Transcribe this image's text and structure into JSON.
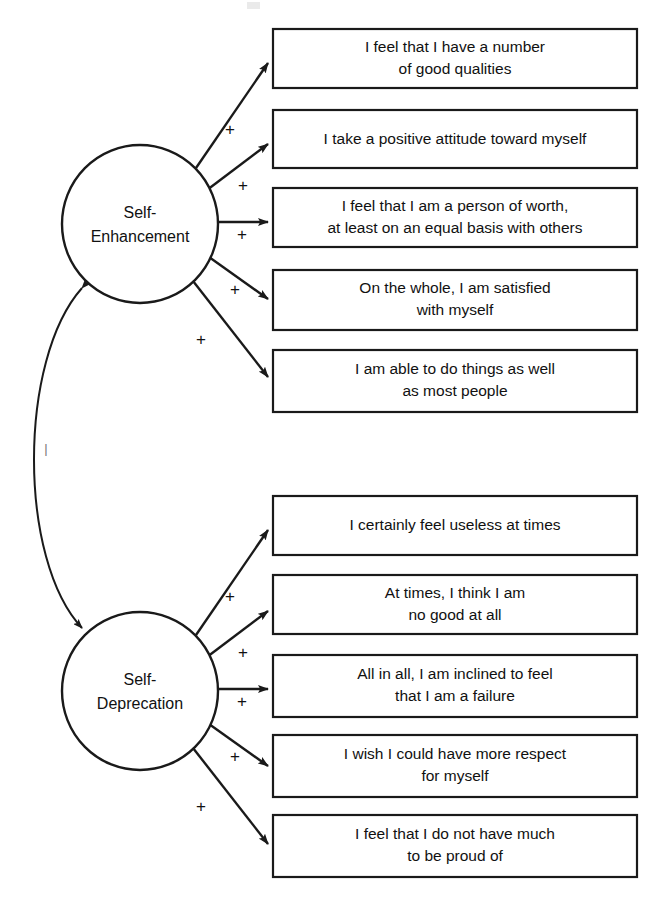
{
  "diagram": {
    "colors": {
      "stroke": "#1a1a1a",
      "box_fill": "#ffffff",
      "text": "#111111",
      "background": "#ffffff",
      "faint_label": "#777777"
    },
    "constructs": [
      {
        "id": "self-enhancement",
        "line1": "Self-",
        "line2": "Enhancement",
        "cx": 140,
        "cy": 224,
        "rx": 78,
        "ry": 79
      },
      {
        "id": "self-deprecation",
        "line1": "Self-",
        "line2": "Deprecation",
        "cx": 140,
        "cy": 691,
        "rx": 78,
        "ry": 79
      }
    ],
    "indicator_boxes": [
      {
        "id": "box-1",
        "construct": "self-enhancement",
        "lines": [
          "I feel that I have a number",
          "of good qualities"
        ],
        "x": 273,
        "y": 29,
        "w": 364,
        "h": 59
      },
      {
        "id": "box-2",
        "construct": "self-enhancement",
        "lines": [
          "I take a positive attitude toward myself"
        ],
        "x": 273,
        "y": 110,
        "w": 364,
        "h": 58
      },
      {
        "id": "box-3",
        "construct": "self-enhancement",
        "lines": [
          "I feel that I am a person of worth,",
          "at least on an equal basis with others"
        ],
        "x": 273,
        "y": 188,
        "w": 364,
        "h": 59
      },
      {
        "id": "box-4",
        "construct": "self-enhancement",
        "lines": [
          "On the whole, I am satisfied",
          "with myself"
        ],
        "x": 273,
        "y": 270,
        "w": 364,
        "h": 60
      },
      {
        "id": "box-5",
        "construct": "self-enhancement",
        "lines": [
          "I am able to do things as well",
          "as most people"
        ],
        "x": 273,
        "y": 350,
        "w": 364,
        "h": 62
      },
      {
        "id": "box-6",
        "construct": "self-deprecation",
        "lines": [
          "I certainly feel useless at times"
        ],
        "x": 273,
        "y": 496,
        "w": 364,
        "h": 59
      },
      {
        "id": "box-7",
        "construct": "self-deprecation",
        "lines": [
          "At times, I think I am",
          "no good at all"
        ],
        "x": 273,
        "y": 575,
        "w": 364,
        "h": 59
      },
      {
        "id": "box-8",
        "construct": "self-deprecation",
        "lines": [
          "All in all, I am inclined to feel",
          "that I am a failure"
        ],
        "x": 273,
        "y": 655,
        "w": 364,
        "h": 62
      },
      {
        "id": "box-9",
        "construct": "self-deprecation",
        "lines": [
          "I wish I could have more respect",
          "for myself"
        ],
        "x": 273,
        "y": 735,
        "w": 364,
        "h": 62
      },
      {
        "id": "box-10",
        "construct": "self-deprecation",
        "lines": [
          "I feel that I do not have much",
          "to be proud of"
        ],
        "x": 273,
        "y": 815,
        "w": 364,
        "h": 62
      }
    ],
    "path_labels": [
      {
        "id": "sign-1",
        "text": "+",
        "x": 230,
        "y": 131
      },
      {
        "id": "sign-2",
        "text": "+",
        "x": 243,
        "y": 187
      },
      {
        "id": "sign-3",
        "text": "+",
        "x": 242,
        "y": 236
      },
      {
        "id": "sign-4",
        "text": "+",
        "x": 235,
        "y": 291
      },
      {
        "id": "sign-5",
        "text": "+",
        "x": 201,
        "y": 341
      },
      {
        "id": "sign-6",
        "text": "+",
        "x": 230,
        "y": 598
      },
      {
        "id": "sign-7",
        "text": "+",
        "x": 243,
        "y": 654
      },
      {
        "id": "sign-8",
        "text": "+",
        "x": 242,
        "y": 703
      },
      {
        "id": "sign-9",
        "text": "+",
        "x": 235,
        "y": 758
      },
      {
        "id": "sign-10",
        "text": "+",
        "x": 201,
        "y": 808
      }
    ],
    "correlation": {
      "id": "construct-correlation",
      "label": "|",
      "label_x": 46,
      "label_y": 450,
      "from": "self-enhancement",
      "to": "self-deprecation"
    }
  }
}
